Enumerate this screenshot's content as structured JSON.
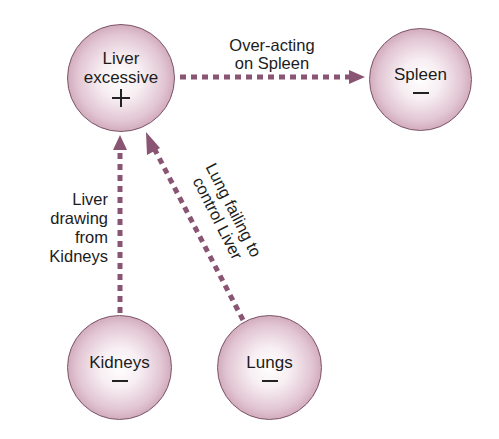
{
  "diagram": {
    "type": "organ-relationship",
    "colors": {
      "arrow": "#8a5573",
      "node_edge": "#7a5366",
      "node_fill_center": "#ffffff",
      "node_fill_outer": "#b58599",
      "text": "#1c1c1c",
      "background": "#ffffff"
    },
    "nodes": [
      {
        "id": "liver",
        "label_line1": "Liver",
        "label_line2": "excessive",
        "sign": "+"
      },
      {
        "id": "spleen",
        "label": "Spleen",
        "sign": "—"
      },
      {
        "id": "kidneys",
        "label": "Kidneys",
        "sign": "—"
      },
      {
        "id": "lungs",
        "label": "Lungs",
        "sign": "—"
      }
    ],
    "edges": [
      {
        "from": "liver",
        "to": "spleen",
        "label_line1": "Over-acting",
        "label_line2": "on Spleen",
        "style": "dashed-arrow"
      },
      {
        "from": "kidneys",
        "to": "liver",
        "label_line1": "Liver",
        "label_line2": "drawing",
        "label_line3": "from",
        "label_line4": "Kidneys",
        "style": "dashed-arrow"
      },
      {
        "from": "lungs",
        "to": "liver",
        "label_line1": "Lung failing to",
        "label_line2": "control Liver",
        "style": "dashed-arrow"
      }
    ]
  }
}
